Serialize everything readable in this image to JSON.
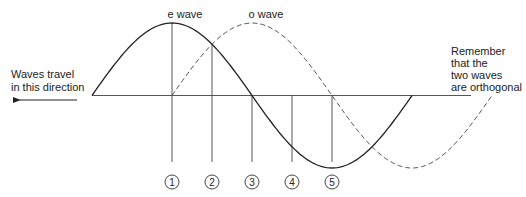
{
  "labels": {
    "e_wave": "e wave",
    "o_wave": "o wave",
    "direction_line1": "Waves travel",
    "direction_line2": "in this direction",
    "note_line1": "Remember",
    "note_line2": "that the",
    "note_line3": "two waves",
    "note_line4": "are orthogonal"
  },
  "markers": [
    "1",
    "2",
    "3",
    "4",
    "5"
  ],
  "waves": {
    "e": {
      "style": "solid",
      "phase_offset_cycles": 0,
      "extent_cycles": 1.0
    },
    "o": {
      "style": "dashed",
      "phase_offset_cycles": 0.25,
      "extent_cycles": 1.0
    }
  },
  "marker_phases_cycles": [
    0.25,
    0.375,
    0.5,
    0.625,
    0.75
  ],
  "colors": {
    "line": "#222222",
    "axis": "#555555",
    "guide": "#444444",
    "dash": "#555555"
  }
}
